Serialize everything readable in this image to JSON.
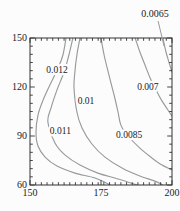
{
  "figure": {
    "kind": "contour-plot"
  },
  "chart_data": {
    "type": "heatmap",
    "subtype": "contour",
    "title": "",
    "xlabel": "",
    "ylabel": "",
    "grid": false,
    "legend_position": "none",
    "x_axis": {
      "min": 150,
      "max": 200,
      "major_ticks": [
        150,
        175,
        200
      ],
      "major_tick_labels": [
        "150",
        "175",
        "200"
      ],
      "minor_step": 2
    },
    "y_axis": {
      "min": 60,
      "max": 150,
      "major_ticks": [
        60,
        90,
        120,
        150
      ],
      "major_tick_labels": [
        "60",
        "90",
        "120",
        "150"
      ],
      "minor_step": 5
    },
    "levels": [
      0.012,
      0.011,
      0.01,
      0.0085,
      0.007,
      0.0065
    ],
    "series": [
      {
        "name": "contour-0.012",
        "level": 0.012,
        "label": "0.012",
        "label_at": {
          "x": 159.5,
          "y": 130.4
        },
        "points": [
          [
            162.7,
            150
          ],
          [
            161.6,
            139.6
          ],
          [
            159.9,
            131.6
          ],
          [
            157.0,
            121.2
          ],
          [
            154.6,
            112.0
          ],
          [
            152.8,
            102.8
          ],
          [
            152.1,
            92.4
          ],
          [
            152.8,
            83.9
          ],
          [
            155.3,
            77.1
          ],
          [
            159.5,
            71.6
          ],
          [
            165.8,
            67.3
          ],
          [
            172.9,
            64.3
          ],
          [
            178.2,
            60
          ]
        ]
      },
      {
        "name": "contour-0.011",
        "level": 0.011,
        "label": "0.011",
        "label_at": {
          "x": 160.7,
          "y": 93.1
        },
        "points": [
          [
            165.1,
            150
          ],
          [
            163.7,
            139.6
          ],
          [
            162.0,
            129.2
          ],
          [
            159.5,
            118.2
          ],
          [
            157.4,
            107.1
          ],
          [
            156.3,
            98.6
          ],
          [
            158.8,
            85.7
          ],
          [
            162.3,
            78.4
          ],
          [
            167.6,
            72.2
          ],
          [
            173.9,
            67.3
          ],
          [
            181.0,
            63.7
          ],
          [
            187.7,
            60
          ]
        ]
      },
      {
        "name": "contour-0.01",
        "level": 0.01,
        "label": "0.01",
        "label_at": {
          "x": 169.7,
          "y": 111.7
        },
        "points": [
          [
            167.6,
            150
          ],
          [
            166.5,
            139.6
          ],
          [
            165.8,
            129.2
          ],
          [
            165.5,
            119.4
          ],
          [
            166.5,
            104.7
          ],
          [
            168.3,
            94.9
          ],
          [
            171.8,
            85.1
          ],
          [
            176.4,
            77.1
          ],
          [
            182.4,
            70.4
          ],
          [
            188.7,
            65.5
          ],
          [
            194.0,
            62.4
          ],
          [
            196.8,
            60
          ]
        ]
      },
      {
        "name": "contour-0.0085",
        "level": 0.0085,
        "label": "0.0085",
        "label_at": {
          "x": 184.9,
          "y": 90.9
        },
        "points": [
          [
            175.0,
            150
          ],
          [
            176.1,
            139.6
          ],
          [
            177.8,
            127.3
          ],
          [
            179.6,
            115.1
          ],
          [
            181.0,
            104.7
          ],
          [
            182.0,
            96.7
          ],
          [
            184.5,
            90.0
          ],
          [
            188.7,
            82.6
          ],
          [
            193.0,
            76.5
          ],
          [
            196.5,
            72.2
          ],
          [
            200.0,
            69.2
          ]
        ]
      },
      {
        "name": "contour-0.007",
        "level": 0.007,
        "label": "0.007",
        "label_at": {
          "x": 191.5,
          "y": 120.3
        },
        "points": [
          [
            187.0,
            150
          ],
          [
            188.7,
            141.4
          ],
          [
            190.5,
            133.5
          ],
          [
            192.3,
            125.5
          ],
          [
            194.4,
            118.2
          ],
          [
            196.1,
            112.6
          ],
          [
            197.9,
            107.7
          ],
          [
            200.0,
            102.2
          ]
        ]
      },
      {
        "name": "contour-0.0065",
        "level": 0.0065,
        "label": "0.0065",
        "label_at": null,
        "points": [
          [
            196.8,
            150
          ],
          [
            197.9,
            141.4
          ],
          [
            198.9,
            135.3
          ],
          [
            200.0,
            129.2
          ]
        ]
      }
    ],
    "callout": {
      "text": "0.0065",
      "text_at": {
        "x": 194.0,
        "y": 162.9
      },
      "line": [
        [
          195.1,
          160.4
        ],
        [
          197.2,
          145.1
        ]
      ]
    },
    "colors": {
      "contour_line": "#969b9b",
      "frame": "#333333",
      "text": "#1b1b1b",
      "background": "#fcfcfc",
      "label_halo": "#fcfcfc"
    },
    "font": {
      "tick_size": 10,
      "label_size": 9.5,
      "callout_size": 10
    }
  }
}
